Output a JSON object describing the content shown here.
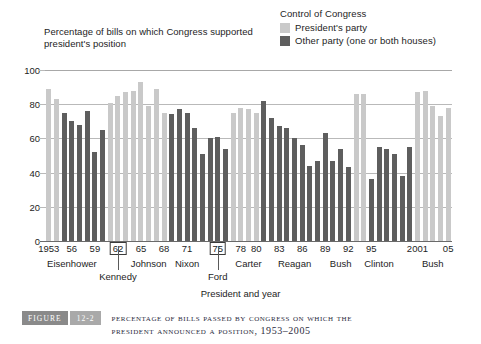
{
  "legend": {
    "title": "Control of Congress",
    "items": [
      {
        "label": "President's party",
        "color": "#c9c9c9"
      },
      {
        "label": "Other party (one or both houses)",
        "color": "#5e5e5e"
      }
    ]
  },
  "caption": {
    "figure_tag": "FIGURE",
    "figure_number": "12-2",
    "line1": "Percentage of Bills Passed by Congress on Which the",
    "line2": "President Announced a Position, 1953–2005"
  },
  "chart_data": {
    "type": "bar",
    "ylabel": "Percentage of bills on which Congress supported president's position",
    "xlabel": "President and year",
    "ylim": [
      0,
      100
    ],
    "yticks": [
      0,
      20,
      40,
      60,
      80,
      100
    ],
    "grid": true,
    "legend_position": "top-right",
    "x_tick_labels": [
      {
        "year": 1953,
        "text": "1953",
        "boxed": false
      },
      {
        "year": 1956,
        "text": "56",
        "boxed": false
      },
      {
        "year": 1959,
        "text": "59",
        "boxed": false
      },
      {
        "year": 1962,
        "text": "62",
        "boxed": true
      },
      {
        "year": 1965,
        "text": "65",
        "boxed": false
      },
      {
        "year": 1968,
        "text": "68",
        "boxed": false
      },
      {
        "year": 1971,
        "text": "71",
        "boxed": false
      },
      {
        "year": 1975,
        "text": "75",
        "boxed": true
      },
      {
        "year": 1978,
        "text": "78",
        "boxed": false
      },
      {
        "year": 1980,
        "text": "80",
        "boxed": false
      },
      {
        "year": 1983,
        "text": "83",
        "boxed": false
      },
      {
        "year": 1986,
        "text": "86",
        "boxed": false
      },
      {
        "year": 1989,
        "text": "89",
        "boxed": false
      },
      {
        "year": 1992,
        "text": "92",
        "boxed": false
      },
      {
        "year": 1995,
        "text": "95",
        "boxed": false
      },
      {
        "year": 2001,
        "text": "2001",
        "boxed": false
      },
      {
        "year": 2005,
        "text": "05",
        "boxed": false
      }
    ],
    "president_labels": [
      {
        "name": "Eisenhower",
        "center_year": 1956,
        "below": false
      },
      {
        "name": "Kennedy",
        "center_year": 1962,
        "below": true
      },
      {
        "name": "Johnson",
        "center_year": 1966,
        "below": false
      },
      {
        "name": "Nixon",
        "center_year": 1971,
        "below": false
      },
      {
        "name": "Ford",
        "center_year": 1975,
        "below": true
      },
      {
        "name": "Carter",
        "center_year": 1979,
        "below": false
      },
      {
        "name": "Reagan",
        "center_year": 1985,
        "below": false
      },
      {
        "name": "Bush",
        "center_year": 1991,
        "below": false
      },
      {
        "name": "Clinton",
        "center_year": 1996,
        "below": false
      },
      {
        "name": "Bush",
        "center_year": 2003,
        "below": false
      }
    ],
    "categories": [
      1953,
      1954,
      1955,
      1956,
      1957,
      1958,
      1959,
      1960,
      1961,
      1962,
      1963,
      1964,
      1965,
      1966,
      1967,
      1968,
      1969,
      1970,
      1971,
      1972,
      1973,
      1974,
      1975,
      1976,
      1977,
      1978,
      1979,
      1980,
      1981,
      1982,
      1983,
      1984,
      1985,
      1986,
      1987,
      1988,
      1989,
      1990,
      1991,
      1992,
      1993,
      1994,
      1995,
      1996,
      1997,
      1998,
      1999,
      2000,
      2001,
      2002,
      2003,
      2004,
      2005
    ],
    "values": [
      89,
      83,
      75,
      70,
      68,
      76,
      52,
      65,
      81,
      85,
      87,
      88,
      93,
      79,
      89,
      75,
      74,
      77,
      75,
      66,
      51,
      60,
      61,
      54,
      75,
      78,
      77,
      75,
      82,
      72,
      67,
      66,
      60,
      56,
      44,
      47,
      63,
      47,
      54,
      43,
      86,
      86,
      36,
      55,
      54,
      51,
      38,
      55,
      87,
      88,
      79,
      73,
      78
    ],
    "control": [
      "president",
      "president",
      "other",
      "other",
      "other",
      "other",
      "other",
      "other",
      "president",
      "president",
      "president",
      "president",
      "president",
      "president",
      "president",
      "president",
      "other",
      "other",
      "other",
      "other",
      "other",
      "other",
      "other",
      "other",
      "president",
      "president",
      "president",
      "president",
      "other",
      "other",
      "other",
      "other",
      "other",
      "other",
      "other",
      "other",
      "other",
      "other",
      "other",
      "other",
      "president",
      "president",
      "other",
      "other",
      "other",
      "other",
      "other",
      "other",
      "president",
      "president",
      "president",
      "president",
      "president"
    ],
    "colors": {
      "president_party": "#c9c9c9",
      "other_party": "#5e5e5e"
    }
  }
}
